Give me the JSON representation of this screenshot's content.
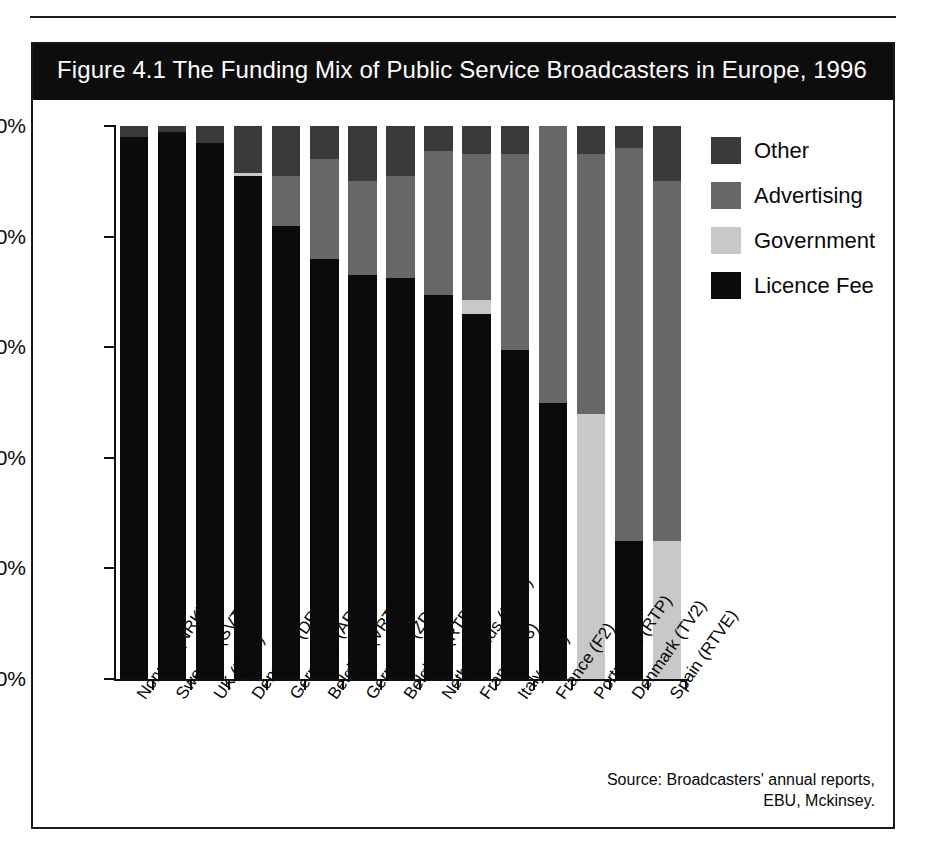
{
  "figure": {
    "title": "Figure 4.1 The Funding Mix of Public Service Broadcasters in Europe, 1996",
    "source_note": "Source: Broadcasters' annual reports, EBU, Mckinsey."
  },
  "colors": {
    "licence_fee": "#0b0b0b",
    "government": "#c8c8c8",
    "advertising": "#676767",
    "other": "#3a3a3a",
    "banner": "#0d0d0d",
    "frame": "#1a1a1a"
  },
  "legend": {
    "position": "right",
    "items": [
      {
        "label": "Other",
        "color": "#3a3a3a",
        "swatch": "other-swatch"
      },
      {
        "label": "Advertising",
        "color": "#676767",
        "swatch": "advertising-swatch"
      },
      {
        "label": "Government",
        "color": "#c8c8c8",
        "swatch": "government-swatch"
      },
      {
        "label": "Licence Fee",
        "color": "#0b0b0b",
        "swatch": "licence-fee-swatch"
      }
    ]
  },
  "chart_data": {
    "type": "bar",
    "stacked": true,
    "orientation": "vertical",
    "title": "Figure 4.1 The Funding Mix of Public Service Broadcasters in Europe, 1996",
    "xlabel": "",
    "ylabel": "",
    "ylim": [
      0,
      100
    ],
    "yticks": [
      0,
      20,
      40,
      60,
      80,
      100
    ],
    "ytick_labels": [
      "0%",
      "20%",
      "40%",
      "60%",
      "80%",
      "100%"
    ],
    "grid": false,
    "legend_position": "right",
    "categories": [
      "Norway (NRK)",
      "Sweden (SVT)",
      "UK (BBC)",
      "Denmark (DR)",
      "Germany (ARD)",
      "Belgium (VRT)",
      "Germany (ZDF)",
      "Belgium (RTBF)",
      "Netherlands (NOS)",
      "France (F3)",
      "Italy (RAI)",
      "France (F2)",
      "Portugual (RTP)",
      "Denmark (TV2)",
      "Spain (RTVE)"
    ],
    "series": [
      {
        "name": "Licence Fee",
        "color": "#0b0b0b",
        "values": [
          98,
          99,
          97,
          91,
          82,
          76,
          73,
          72.5,
          69.5,
          66,
          59.5,
          50,
          0,
          25,
          0
        ]
      },
      {
        "name": "Government",
        "color": "#c8c8c8",
        "values": [
          0,
          0,
          0,
          0.5,
          0,
          0,
          0,
          0,
          0,
          2.5,
          0,
          0,
          48,
          0,
          25
        ]
      },
      {
        "name": "Advertising",
        "color": "#676767",
        "values": [
          0,
          0,
          0,
          0,
          9,
          18,
          17,
          18.5,
          26,
          26.5,
          35.5,
          50,
          47,
          71,
          65
        ]
      },
      {
        "name": "Other",
        "color": "#3a3a3a",
        "values": [
          2,
          1,
          3,
          8.5,
          9,
          6,
          10,
          9,
          4.5,
          5,
          5,
          0,
          5,
          4,
          10
        ]
      }
    ]
  }
}
